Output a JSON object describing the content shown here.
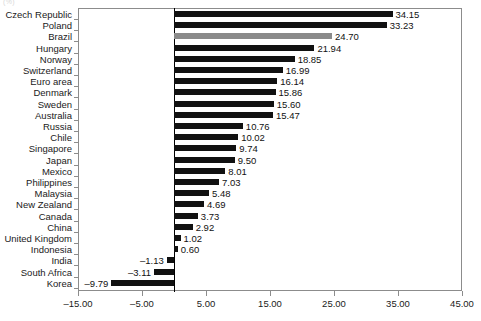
{
  "corner_mark": "(%)",
  "chart_data": {
    "type": "bar",
    "orientation": "horizontal",
    "title": "",
    "subtitle": "",
    "xlabel": "",
    "ylabel": "",
    "xlim": [
      -15.0,
      45.0
    ],
    "xticks": [
      "-15.00",
      "-5.00",
      "5.00",
      "15.00",
      "25.00",
      "35.00",
      "45.00"
    ],
    "xtick_values": [
      -15,
      -5,
      5,
      15,
      25,
      35,
      45
    ],
    "grid": false,
    "legend": "none",
    "bar_color": "#111111",
    "highlight_color": "#8a8a8a",
    "highlight_category": "Brazil",
    "categories": [
      "Czech Republic",
      "Poland",
      "Brazil",
      "Hungary",
      "Norway",
      "Switzerland",
      "Euro area",
      "Denmark",
      "Sweden",
      "Australia",
      "Russia",
      "Chile",
      "Singapore",
      "Japan",
      "Mexico",
      "Philippines",
      "Malaysia",
      "New Zealand",
      "Canada",
      "China",
      "United Kingdom",
      "Indonesia",
      "India",
      "South Africa",
      "Korea"
    ],
    "values": [
      34.15,
      33.23,
      24.7,
      21.94,
      18.85,
      16.99,
      16.14,
      15.86,
      15.6,
      15.47,
      10.76,
      10.02,
      9.74,
      9.5,
      8.01,
      7.03,
      5.48,
      4.69,
      3.73,
      2.92,
      1.02,
      0.6,
      -1.13,
      -3.11,
      -9.79
    ],
    "value_labels": [
      "34.15",
      "33.23",
      "24.70",
      "21.94",
      "18.85",
      "16.99",
      "16.14",
      "15.86",
      "15.60",
      "15.47",
      "10.76",
      "10.02",
      "9.74",
      "9.50",
      "8.01",
      "7.03",
      "5.48",
      "4.69",
      "3.73",
      "2.92",
      "1.02",
      "0.60",
      "-1.13",
      "-3.11",
      "-9.79"
    ]
  }
}
